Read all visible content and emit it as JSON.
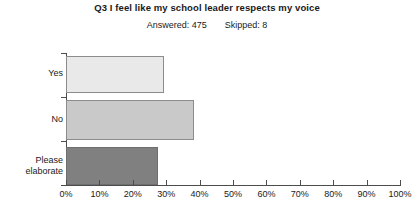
{
  "chart_data": {
    "type": "bar",
    "orientation": "horizontal",
    "title": "Q3 I feel like my school leader respects my voice",
    "subtitle": {
      "answered_label": "Answered: 475",
      "skipped_label": "Skipped: 8"
    },
    "categories": [
      "Yes",
      "No",
      "Please elaborate"
    ],
    "values": [
      29.3,
      38.3,
      27.5
    ],
    "xlabel": "",
    "ylabel": "",
    "xlim": [
      0,
      100
    ],
    "grid": false,
    "legend": null,
    "x_ticks": [
      "0%",
      "10%",
      "20%",
      "30%",
      "40%",
      "50%",
      "60%",
      "70%",
      "80%",
      "90%",
      "100%"
    ],
    "x_tick_values": [
      0,
      10,
      20,
      30,
      40,
      50,
      60,
      70,
      80,
      90,
      100
    ],
    "bar_colors": [
      "#e9e9e9",
      "#c9c9c9",
      "#808080"
    ],
    "bar_border_color": "#8c8c8c",
    "axis_color": "#4d4d4d",
    "background": "#ffffff"
  }
}
